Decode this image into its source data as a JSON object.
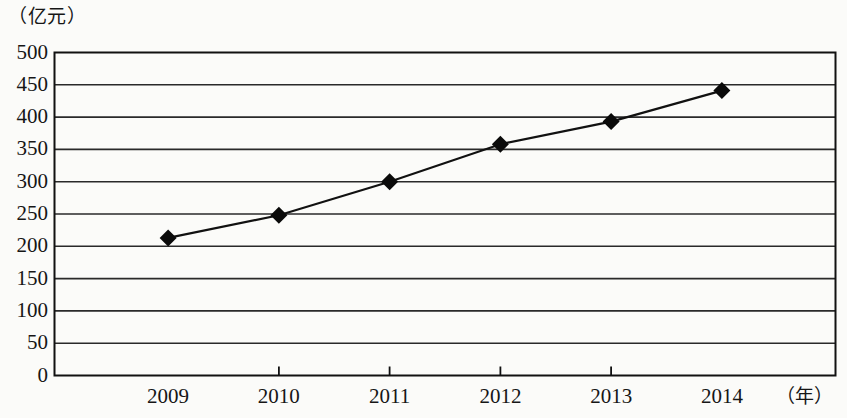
{
  "chart_data": {
    "type": "line",
    "title": "",
    "subtitle": "",
    "xlabel": "（年）",
    "ylabel": "（亿元）",
    "categories": [
      "2009",
      "2010",
      "2011",
      "2012",
      "2013",
      "2014"
    ],
    "values": [
      213,
      248,
      300,
      358,
      393,
      441
    ],
    "series": [
      {
        "name": "",
        "values": [
          213,
          248,
          300,
          358,
          393,
          441
        ]
      }
    ],
    "ylim": [
      0,
      500
    ],
    "ytick_labels": [
      "500",
      "450",
      "400",
      "350",
      "300",
      "250",
      "200",
      "150",
      "100",
      "50",
      "0"
    ],
    "ytick_values": [
      500,
      450,
      400,
      350,
      300,
      250,
      200,
      150,
      100,
      50,
      0
    ],
    "ystep": 50,
    "xtick_labels": [
      "2009",
      "2010",
      "2011",
      "2012",
      "2013",
      "2014"
    ],
    "grid": "horizontal",
    "legend": "none",
    "marker": "diamond",
    "colors": {
      "line": "#111111",
      "marker": "#0a0a0a",
      "grid": "#2a2a2a",
      "axis": "#111111",
      "background": "#fbfbf9"
    }
  },
  "axes": {
    "y_unit_caption": "（亿元）",
    "x_unit_caption": "（年）"
  }
}
